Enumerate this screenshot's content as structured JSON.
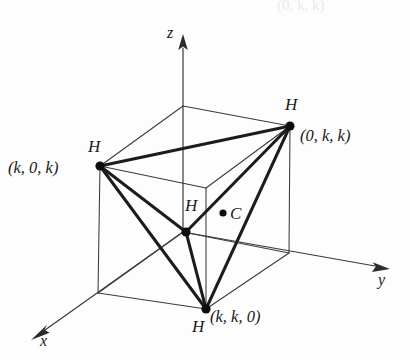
{
  "figure": {
    "title_fragment_top": "(0, k, k)",
    "axes": [
      {
        "name": "z",
        "label": "z"
      },
      {
        "name": "y",
        "label": "y"
      },
      {
        "name": "x",
        "label": "x"
      }
    ],
    "atoms": [
      {
        "id": "h-top-right",
        "element": "H",
        "coordinate": "(0, k, k)",
        "px": 290,
        "py": 126
      },
      {
        "id": "h-left",
        "element": "H",
        "coordinate": "(k, 0, k)",
        "px": 100,
        "py": 166
      },
      {
        "id": "h-center",
        "element": "H",
        "coordinate": "",
        "px": 186,
        "py": 232
      },
      {
        "id": "h-bottom",
        "element": "H",
        "coordinate": "(k, k, 0)",
        "px": 206,
        "py": 309
      }
    ],
    "center_atom": {
      "id": "c-center",
      "element": "C",
      "px": 223,
      "py": 213
    },
    "colors": {
      "line": "#2b2b2b",
      "bond": "#1c1c1c",
      "text": "#1a1a1a",
      "background": "#fdfdfd",
      "faded_text": "#e9e9ec"
    },
    "geometry": {
      "projection": "oblique",
      "cube_vertices": {
        "back_top": [
          183,
          106
        ],
        "left_top": [
          100,
          166
        ],
        "right_top": [
          290,
          126
        ],
        "front_top": [
          206,
          188
        ],
        "back_bottom": [
          183,
          232
        ],
        "left_bottom": [
          98,
          293
        ],
        "right_bottom": [
          289,
          253
        ],
        "front_bottom": [
          206,
          309
        ]
      }
    }
  }
}
